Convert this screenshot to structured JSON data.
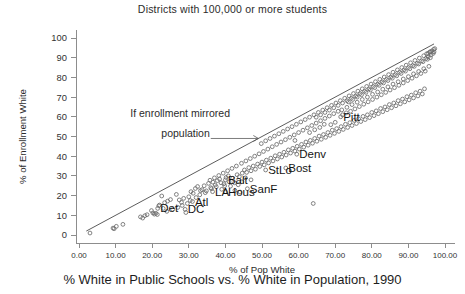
{
  "chart_title": "Districts with 100,000 or more students",
  "figure_caption": "% White in Public Schools vs. % White in Population, 1990",
  "axes": {
    "xlabel": "% of Pop White",
    "ylabel": "% of Enrollment White",
    "xticks": [
      "0.00",
      "10.00",
      "20.00",
      "30.00",
      "40.00",
      "50.00",
      "60.00",
      "70.00",
      "80.00",
      "90.00",
      "100.00"
    ],
    "yticks": [
      "0",
      "10",
      "20",
      "30",
      "40",
      "50",
      "60",
      "70",
      "80",
      "90",
      "100"
    ]
  },
  "annotation": {
    "line1": "If enrollment mirrored",
    "line2": "population"
  },
  "chart_data": {
    "type": "scatter",
    "title": "Districts with 100,000 or more students",
    "subtitle": "% White in Public Schools vs. % White in Population, 1990",
    "xlabel": "% of Pop White",
    "ylabel": "% of Enrollment White",
    "xlim": [
      0,
      100
    ],
    "ylim": [
      0,
      100
    ],
    "xticks": [
      0,
      10,
      20,
      30,
      40,
      50,
      60,
      70,
      80,
      90,
      100
    ],
    "yticks": [
      0,
      10,
      20,
      30,
      40,
      50,
      60,
      70,
      80,
      90,
      100
    ],
    "grid": false,
    "legend": "none",
    "marker": "open-circle",
    "marker_color": "#6b6b6b",
    "reference_line": {
      "label": "If enrollment mirrored population",
      "description": "y = x diagonal identity line",
      "from": [
        2,
        2
      ],
      "to": [
        97,
        97
      ],
      "color": "#4a4a4a"
    },
    "annotations": [
      {
        "text": "If enrollment mirrored population",
        "x": 14,
        "y": 60,
        "arrow_from": [
          36,
          49
        ],
        "arrow_to": [
          49,
          49
        ]
      }
    ],
    "labeled_points": [
      {
        "label": "Det",
        "x": 21.5,
        "y": 13.5
      },
      {
        "label": "DC",
        "x": 29.0,
        "y": 13.0
      },
      {
        "label": "Atl",
        "x": 31.0,
        "y": 17.0
      },
      {
        "label": "LA",
        "x": 36.5,
        "y": 22.0
      },
      {
        "label": "Hous",
        "x": 40.0,
        "y": 22.0
      },
      {
        "label": "Balt",
        "x": 40.0,
        "y": 28.0
      },
      {
        "label": "SanF",
        "x": 46.0,
        "y": 23.5
      },
      {
        "label": "StLo",
        "x": 51.0,
        "y": 33.0
      },
      {
        "label": "Bost",
        "x": 56.5,
        "y": 34.0
      },
      {
        "label": "Denv",
        "x": 59.5,
        "y": 41.0
      },
      {
        "label": "Pitt",
        "x": 71.5,
        "y": 60.0
      }
    ],
    "points": [
      [
        3.0,
        1.0
      ],
      [
        9.3,
        3.5
      ],
      [
        9.6,
        3.2
      ],
      [
        10.2,
        4.4
      ],
      [
        12.0,
        5.4
      ],
      [
        16.8,
        9.2
      ],
      [
        17.4,
        8.6
      ],
      [
        18.0,
        9.8
      ],
      [
        18.6,
        10.3
      ],
      [
        19.8,
        12.4
      ],
      [
        20.2,
        11.2
      ],
      [
        20.6,
        10.6
      ],
      [
        21.0,
        11.0
      ],
      [
        21.4,
        10.4
      ],
      [
        21.8,
        14.8
      ],
      [
        22.0,
        15.2
      ],
      [
        22.6,
        19.8
      ],
      [
        23.4,
        16.4
      ],
      [
        24.2,
        17.2
      ],
      [
        25.0,
        18.0
      ],
      [
        26.6,
        20.6
      ],
      [
        27.4,
        17.8
      ],
      [
        28.0,
        16.6
      ],
      [
        28.6,
        18.6
      ],
      [
        29.2,
        11.4
      ],
      [
        30.0,
        19.4
      ],
      [
        30.6,
        22.0
      ],
      [
        31.2,
        21.2
      ],
      [
        31.8,
        23.6
      ],
      [
        32.4,
        24.6
      ],
      [
        33.0,
        20.4
      ],
      [
        33.6,
        23.0
      ],
      [
        34.2,
        25.0
      ],
      [
        34.8,
        22.4
      ],
      [
        35.4,
        26.2
      ],
      [
        36.0,
        24.0
      ],
      [
        36.6,
        26.8
      ],
      [
        37.2,
        25.4
      ],
      [
        37.8,
        27.6
      ],
      [
        38.4,
        28.4
      ],
      [
        39.0,
        23.2
      ],
      [
        39.6,
        26.0
      ],
      [
        40.2,
        29.2
      ],
      [
        40.8,
        30.0
      ],
      [
        41.4,
        24.8
      ],
      [
        42.0,
        28.8
      ],
      [
        42.6,
        22.6
      ],
      [
        43.2,
        30.6
      ],
      [
        43.8,
        29.6
      ],
      [
        44.0,
        21.8
      ],
      [
        44.6,
        31.4
      ],
      [
        45.2,
        33.0
      ],
      [
        45.8,
        31.8
      ],
      [
        46.4,
        34.2
      ],
      [
        47.0,
        32.6
      ],
      [
        47.6,
        35.0
      ],
      [
        48.2,
        33.4
      ],
      [
        48.8,
        36.0
      ],
      [
        49.4,
        34.8
      ],
      [
        50.0,
        37.0
      ],
      [
        50.6,
        35.6
      ],
      [
        51.2,
        38.0
      ],
      [
        51.8,
        36.6
      ],
      [
        52.4,
        39.0
      ],
      [
        53.0,
        37.6
      ],
      [
        53.6,
        40.2
      ],
      [
        54.2,
        38.6
      ],
      [
        54.8,
        41.0
      ],
      [
        55.4,
        39.6
      ],
      [
        56.0,
        42.0
      ],
      [
        56.6,
        40.6
      ],
      [
        57.2,
        43.2
      ],
      [
        57.8,
        41.6
      ],
      [
        58.4,
        44.0
      ],
      [
        59.0,
        42.6
      ],
      [
        59.6,
        45.0
      ],
      [
        60.2,
        43.6
      ],
      [
        60.8,
        46.0
      ],
      [
        61.4,
        44.6
      ],
      [
        62.0,
        47.2
      ],
      [
        62.6,
        45.6
      ],
      [
        63.2,
        48.0
      ],
      [
        63.8,
        46.6
      ],
      [
        64.0,
        16.0
      ],
      [
        64.4,
        49.0
      ],
      [
        65.0,
        47.6
      ],
      [
        65.6,
        50.2
      ],
      [
        66.2,
        48.6
      ],
      [
        66.8,
        51.0
      ],
      [
        67.4,
        49.6
      ],
      [
        68.0,
        52.0
      ],
      [
        68.6,
        50.6
      ],
      [
        69.2,
        53.2
      ],
      [
        69.8,
        51.6
      ],
      [
        70.4,
        54.0
      ],
      [
        71.0,
        52.6
      ],
      [
        71.6,
        55.0
      ],
      [
        72.2,
        53.6
      ],
      [
        72.8,
        56.2
      ],
      [
        73.4,
        54.6
      ],
      [
        74.0,
        57.0
      ],
      [
        74.6,
        55.6
      ],
      [
        75.2,
        58.2
      ],
      [
        75.8,
        56.6
      ],
      [
        76.4,
        59.0
      ],
      [
        77.0,
        57.6
      ],
      [
        77.6,
        60.2
      ],
      [
        78.2,
        58.6
      ],
      [
        78.8,
        61.0
      ],
      [
        79.4,
        59.6
      ],
      [
        80.0,
        62.2
      ],
      [
        80.6,
        60.6
      ],
      [
        81.2,
        63.0
      ],
      [
        81.8,
        61.6
      ],
      [
        82.4,
        64.2
      ],
      [
        83.0,
        62.6
      ],
      [
        83.6,
        65.0
      ],
      [
        84.2,
        63.6
      ],
      [
        84.8,
        66.2
      ],
      [
        85.4,
        64.6
      ],
      [
        86.0,
        67.0
      ],
      [
        86.6,
        65.6
      ],
      [
        87.2,
        68.2
      ],
      [
        87.8,
        66.6
      ],
      [
        88.4,
        69.0
      ],
      [
        89.0,
        67.6
      ],
      [
        89.6,
        70.2
      ],
      [
        90.2,
        68.6
      ],
      [
        90.8,
        71.0
      ],
      [
        91.4,
        69.6
      ],
      [
        92.0,
        72.2
      ],
      [
        92.6,
        70.6
      ],
      [
        93.2,
        73.0
      ],
      [
        93.8,
        71.6
      ],
      [
        94.4,
        74.2
      ],
      [
        49.8,
        46.4
      ],
      [
        51.0,
        47.8
      ],
      [
        52.2,
        49.0
      ],
      [
        53.4,
        50.2
      ],
      [
        54.6,
        51.4
      ],
      [
        55.8,
        52.6
      ],
      [
        57.0,
        53.8
      ],
      [
        58.2,
        55.0
      ],
      [
        59.4,
        56.2
      ],
      [
        60.6,
        57.4
      ],
      [
        61.8,
        58.6
      ],
      [
        63.0,
        59.8
      ],
      [
        64.2,
        61.0
      ],
      [
        65.4,
        62.2
      ],
      [
        66.6,
        63.4
      ],
      [
        67.8,
        64.6
      ],
      [
        69.0,
        65.8
      ],
      [
        70.2,
        67.0
      ],
      [
        71.4,
        68.2
      ],
      [
        72.6,
        69.4
      ],
      [
        73.8,
        70.6
      ],
      [
        75.0,
        71.8
      ],
      [
        76.2,
        73.0
      ],
      [
        77.4,
        74.2
      ],
      [
        78.6,
        75.4
      ],
      [
        79.8,
        76.6
      ],
      [
        81.0,
        77.8
      ],
      [
        82.2,
        79.0
      ],
      [
        83.4,
        80.2
      ],
      [
        84.6,
        81.4
      ],
      [
        85.8,
        82.6
      ],
      [
        87.0,
        83.8
      ],
      [
        88.2,
        85.0
      ],
      [
        89.4,
        86.2
      ],
      [
        90.6,
        87.4
      ],
      [
        91.8,
        88.6
      ],
      [
        93.0,
        89.8
      ],
      [
        94.2,
        91.0
      ],
      [
        95.0,
        92.0
      ],
      [
        95.8,
        92.8
      ],
      [
        96.4,
        93.4
      ],
      [
        96.9,
        94.2
      ],
      [
        97.2,
        94.6
      ],
      [
        96.0,
        93.0
      ],
      [
        95.4,
        92.2
      ],
      [
        72.0,
        61.0
      ],
      [
        73.0,
        62.0
      ],
      [
        74.2,
        62.8
      ],
      [
        75.4,
        64.0
      ],
      [
        76.6,
        65.2
      ],
      [
        77.8,
        66.4
      ],
      [
        79.0,
        67.6
      ],
      [
        80.2,
        68.8
      ],
      [
        81.4,
        70.0
      ],
      [
        82.6,
        71.2
      ],
      [
        83.8,
        72.4
      ],
      [
        85.0,
        73.6
      ],
      [
        86.2,
        74.8
      ],
      [
        87.4,
        76.0
      ],
      [
        88.6,
        77.2
      ],
      [
        89.8,
        78.4
      ],
      [
        91.0,
        79.6
      ],
      [
        92.2,
        80.8
      ],
      [
        93.4,
        82.0
      ],
      [
        94.6,
        83.2
      ],
      [
        88.0,
        82.0
      ],
      [
        89.2,
        83.2
      ],
      [
        90.4,
        84.4
      ],
      [
        91.6,
        85.6
      ],
      [
        92.8,
        86.8
      ],
      [
        94.0,
        88.0
      ],
      [
        95.2,
        89.2
      ],
      [
        96.0,
        90.0
      ],
      [
        86.8,
        80.8
      ],
      [
        85.6,
        79.6
      ],
      [
        84.4,
        78.4
      ],
      [
        83.2,
        77.2
      ],
      [
        82.0,
        76.0
      ],
      [
        80.8,
        74.8
      ],
      [
        79.6,
        73.6
      ],
      [
        78.4,
        72.4
      ],
      [
        77.2,
        71.2
      ],
      [
        76.0,
        70.0
      ],
      [
        74.8,
        68.8
      ],
      [
        73.6,
        67.6
      ],
      [
        66.0,
        58.0
      ],
      [
        67.2,
        59.2
      ],
      [
        68.4,
        60.4
      ],
      [
        69.6,
        61.6
      ],
      [
        70.8,
        62.8
      ],
      [
        62.4,
        54.4
      ],
      [
        63.6,
        55.6
      ],
      [
        64.8,
        56.8
      ],
      [
        61.2,
        53.2
      ],
      [
        60.0,
        52.0
      ],
      [
        58.8,
        50.8
      ],
      [
        57.6,
        49.6
      ],
      [
        56.4,
        48.4
      ],
      [
        55.2,
        47.2
      ],
      [
        54.0,
        46.0
      ],
      [
        52.8,
        44.8
      ],
      [
        51.6,
        43.6
      ],
      [
        50.4,
        42.4
      ],
      [
        49.2,
        41.2
      ],
      [
        48.0,
        40.0
      ],
      [
        46.8,
        38.8
      ],
      [
        45.6,
        37.6
      ],
      [
        44.4,
        36.4
      ],
      [
        43.0,
        35.0
      ],
      [
        41.8,
        33.8
      ],
      [
        40.6,
        32.6
      ],
      [
        39.4,
        31.4
      ],
      [
        38.2,
        30.2
      ],
      [
        37.0,
        29.0
      ],
      [
        35.8,
        27.8
      ],
      [
        71.8,
        63.5
      ],
      [
        73.2,
        64.8
      ],
      [
        74.6,
        66.2
      ],
      [
        76.0,
        67.4
      ],
      [
        77.4,
        68.8
      ],
      [
        78.8,
        70.0
      ],
      [
        80.2,
        71.4
      ],
      [
        81.6,
        72.6
      ],
      [
        83.0,
        74.0
      ],
      [
        84.4,
        75.2
      ],
      [
        85.8,
        76.6
      ],
      [
        87.2,
        77.8
      ],
      [
        88.6,
        79.2
      ],
      [
        90.0,
        80.4
      ],
      [
        91.4,
        81.8
      ],
      [
        92.8,
        83.0
      ],
      [
        94.2,
        84.4
      ],
      [
        95.6,
        85.6
      ],
      [
        68.8,
        56.0
      ],
      [
        70.0,
        57.2
      ],
      [
        63.0,
        52.0
      ],
      [
        64.4,
        53.4
      ],
      [
        65.8,
        54.6
      ],
      [
        67.0,
        56.2
      ],
      [
        59.0,
        48.0
      ],
      [
        90.0,
        85.0
      ],
      [
        91.2,
        86.0
      ],
      [
        92.4,
        87.2
      ],
      [
        93.6,
        88.4
      ],
      [
        94.8,
        89.6
      ],
      [
        95.4,
        90.4
      ],
      [
        96.2,
        91.4
      ],
      [
        96.8,
        92.2
      ],
      [
        97.0,
        93.0
      ],
      [
        88.8,
        83.8
      ],
      [
        87.6,
        82.6
      ],
      [
        86.4,
        81.4
      ],
      [
        85.2,
        80.2
      ],
      [
        84.0,
        79.0
      ],
      [
        82.8,
        77.8
      ],
      [
        81.6,
        76.6
      ],
      [
        80.4,
        75.4
      ],
      [
        79.2,
        74.2
      ],
      [
        78.0,
        73.0
      ],
      [
        76.8,
        71.8
      ],
      [
        75.6,
        70.6
      ],
      [
        74.4,
        69.4
      ],
      [
        73.2,
        68.2
      ],
      [
        72.0,
        67.0
      ],
      [
        70.8,
        65.8
      ],
      [
        69.6,
        64.6
      ],
      [
        68.4,
        63.4
      ],
      [
        67.2,
        62.2
      ],
      [
        66.0,
        61.0
      ],
      [
        64.8,
        59.8
      ],
      [
        43.5,
        25.5
      ],
      [
        44.5,
        27.0
      ],
      [
        45.5,
        29.0
      ],
      [
        47.0,
        28.0
      ],
      [
        42.5,
        26.5
      ],
      [
        41.0,
        27.0
      ],
      [
        39.8,
        25.0
      ],
      [
        38.8,
        26.5
      ],
      [
        37.5,
        24.5
      ],
      [
        36.2,
        23.5
      ],
      [
        34.5,
        21.5
      ],
      [
        33.2,
        22.5
      ],
      [
        32.0,
        19.0
      ],
      [
        30.4,
        17.5
      ],
      [
        29.6,
        16.0
      ],
      [
        28.2,
        15.0
      ],
      [
        27.0,
        14.0
      ],
      [
        25.6,
        13.0
      ],
      [
        24.0,
        12.0
      ],
      [
        23.0,
        13.5
      ]
    ]
  }
}
